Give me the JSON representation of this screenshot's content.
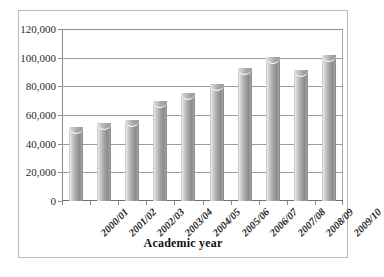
{
  "chart_data": {
    "type": "bar",
    "title": "",
    "subtitle": "",
    "xlabel": "Academic year",
    "ylabel": "",
    "categories": [
      "2000/01",
      "2001/02",
      "2002/03",
      "2003/04",
      "2004/05",
      "2005/06",
      "2006/07",
      "2007/08",
      "2008/09",
      "2009/10"
    ],
    "values": [
      51000,
      54000,
      56000,
      69000,
      75000,
      81000,
      92000,
      100000,
      91000,
      101000
    ],
    "ylim": [
      0,
      120000
    ],
    "ytick_values": [
      0,
      20000,
      40000,
      60000,
      80000,
      100000,
      120000
    ],
    "ytick_labels": [
      "0",
      "20,000",
      "40,000",
      "60,000",
      "80,000",
      "100,000",
      "120,000"
    ],
    "grid": true,
    "legend": false,
    "legend_position": "none",
    "bar_color": "#9a9a9a",
    "bar_style": "cylinder-gradient-grayscale",
    "gridline_color": "#9c9c9c",
    "frame_color": "#b9b9b9"
  },
  "axis": {
    "x_title": "Academic year"
  }
}
